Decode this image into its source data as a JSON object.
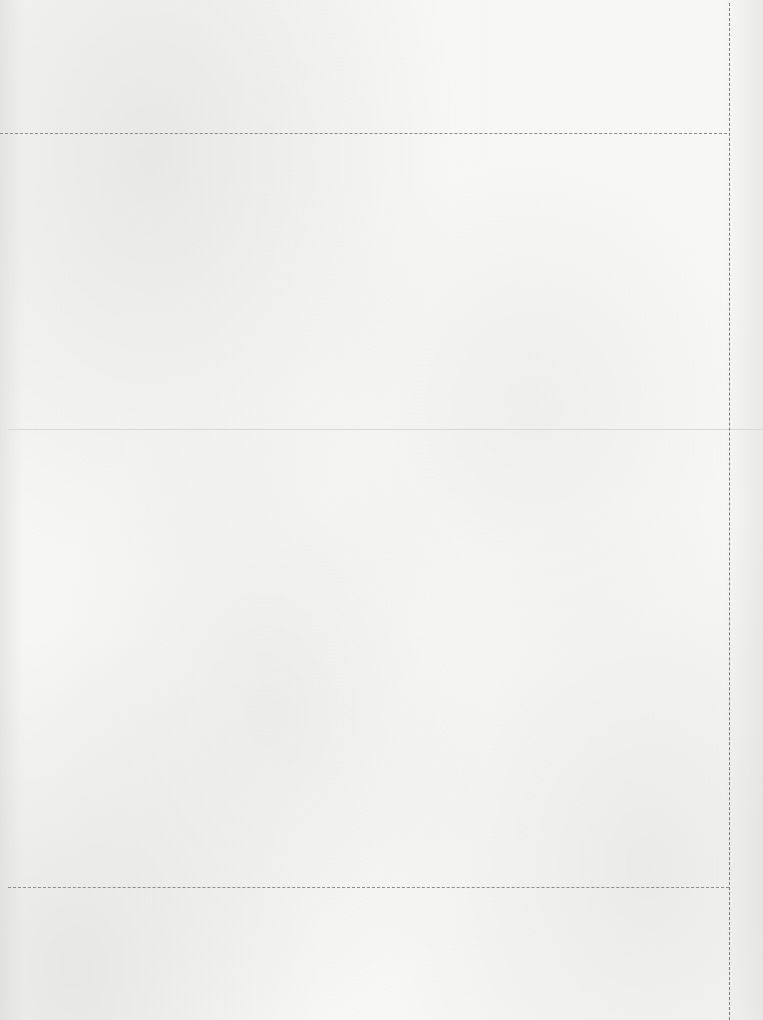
{
  "document": {
    "type": "blank paper template",
    "sections": [
      {
        "name": "top-strip",
        "content": ""
      },
      {
        "name": "upper-panel",
        "content": ""
      },
      {
        "name": "lower-panel",
        "content": ""
      },
      {
        "name": "bottom-strip",
        "content": ""
      }
    ],
    "guides": {
      "top_cut_line": "dashed",
      "right_cut_line": "dashed",
      "middle_fold_line": "solid",
      "bottom_cut_line": "dashed"
    },
    "colors": {
      "paper": "#f3f3f2",
      "dashed_line": "#8c8c8c",
      "fold_line": "#d9d9d7"
    }
  }
}
